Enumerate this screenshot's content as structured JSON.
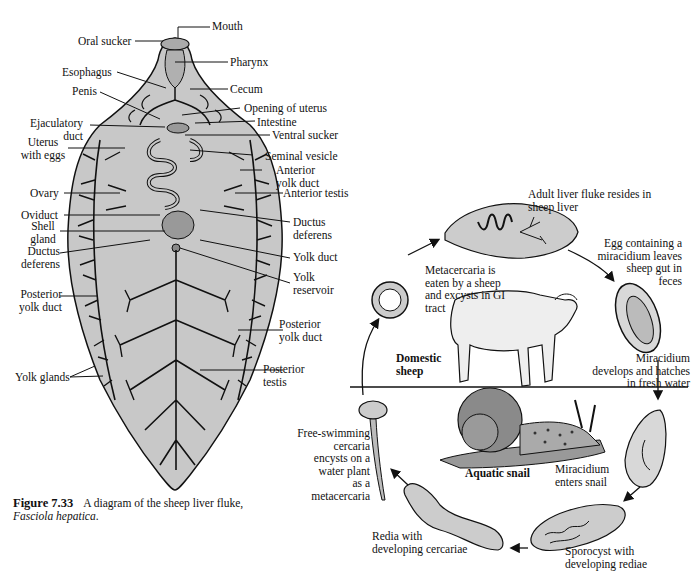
{
  "fluke_anatomy": {
    "labels": {
      "mouth": "Mouth",
      "oral_sucker": "Oral sucker",
      "pharynx": "Pharynx",
      "esophagus": "Esophagus",
      "cecum": "Cecum",
      "penis": "Penis",
      "opening_of_uterus": "Opening of uterus",
      "ejaculatory_duct_1": "Ejaculatory",
      "ejaculatory_duct_2": "duct",
      "intestine": "Intestine",
      "uterus_1": "Uterus",
      "uterus_2": "with eggs",
      "ventral_sucker": "Ventral sucker",
      "seminal_vesicle": "Seminal vesicle",
      "anterior_yolk_duct_1": "Anterior",
      "anterior_yolk_duct_2": "yolk duct",
      "ovary": "Ovary",
      "anterior_testis": "Anterior testis",
      "oviduct": "Oviduct",
      "shell_gland_1": "Shell",
      "shell_gland_2": "gland",
      "ductus_deferens_left_1": "Ductus",
      "ductus_deferens_left_2": "deferens",
      "ductus_deferens_right_1": "Ductus",
      "ductus_deferens_right_2": "deferens",
      "yolk_duct": "Yolk duct",
      "yolk_reservoir_1": "Yolk",
      "yolk_reservoir_2": "reservoir",
      "posterior_yolk_duct_left_1": "Posterior",
      "posterior_yolk_duct_left_2": "yolk duct",
      "posterior_yolk_duct_right_1": "Posterior",
      "posterior_yolk_duct_right_2": "yolk duct",
      "yolk_glands": "Yolk glands",
      "posterior_testis_1": "Posterior",
      "posterior_testis_2": "testis"
    }
  },
  "caption": {
    "figure_number": "Figure 7.33",
    "text": "A diagram of the sheep liver fluke,",
    "species": "Fasciola hepatica",
    "period": "."
  },
  "life_cycle": {
    "hosts": {
      "definitive": [
        "Domestic",
        "sheep"
      ],
      "intermediate": "Aquatic snail"
    },
    "stages": {
      "adult": [
        "Adult liver fluke resides in",
        "sheep liver"
      ],
      "egg": [
        "Egg containing a",
        "miracidium leaves",
        "sheep gut in",
        "feces"
      ],
      "miracidium_hatch": [
        "Miracidium",
        "develops and hatches",
        "in fresh water"
      ],
      "miracidium_enters": [
        "Miracidium",
        "enters snail"
      ],
      "sporocyst": [
        "Sporocyst with",
        "developing rediae"
      ],
      "redia": [
        "Redia with",
        "developing cercariae"
      ],
      "cercaria": [
        "Free-swimming",
        "cercaria",
        "encysts on a",
        "water plant",
        "as a",
        "metacercaria"
      ],
      "metacercaria": [
        "Metacercaria is",
        "eaten by a sheep",
        "and excysts in GI",
        "tract"
      ]
    }
  },
  "colors": {
    "body_fill": "#c8c8c8",
    "ink": "#111111",
    "snail_shell": "#8a8a8a"
  }
}
